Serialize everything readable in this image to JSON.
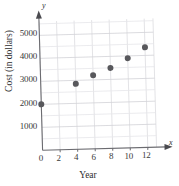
{
  "chart_data": {
    "type": "scatter",
    "title": "",
    "xlabel": "Year",
    "ylabel": "Cost (in dollars)",
    "x_var_label": "x",
    "y_var_label": "y",
    "x": [
      0,
      4,
      6,
      8,
      10,
      12
    ],
    "values": [
      2000,
      2850,
      3200,
      3500,
      3900,
      4350
    ],
    "points": [
      {
        "x": 0,
        "y": 2000
      },
      {
        "x": 4,
        "y": 2850
      },
      {
        "x": 6,
        "y": 3200
      },
      {
        "x": 8,
        "y": 3500
      },
      {
        "x": 10,
        "y": 3900
      },
      {
        "x": 12,
        "y": 4350
      }
    ],
    "xlim": [
      0,
      13
    ],
    "ylim": [
      0,
      5600
    ],
    "xticks": [
      0,
      2,
      4,
      6,
      8,
      10,
      12
    ],
    "xtick_labels": [
      "0",
      "2",
      "4",
      "6",
      "8",
      "10",
      "12"
    ],
    "yticks": [
      1000,
      2000,
      3000,
      4000,
      5000
    ],
    "ytick_labels": [
      "1000",
      "2000",
      "3000",
      "4000",
      "5000"
    ],
    "grid": true,
    "legend": null,
    "marker_color": "#58585c",
    "grid_color": "#d8d8dc",
    "axis_color": "#6b6b70"
  }
}
